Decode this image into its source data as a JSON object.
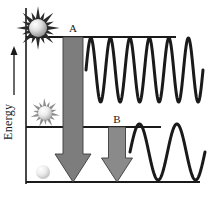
{
  "figure": {
    "type": "energy-level-diagram",
    "background": "#ffffff",
    "width": 208,
    "height": 200
  },
  "axis": {
    "y_label": "Energy",
    "y_arrow_direction": "up",
    "line_color": "#1a1a1a",
    "x_position": 26,
    "top": 8,
    "bottom": 184
  },
  "levels": [
    {
      "id": "excited-high",
      "name": "upper-energy-level",
      "y": 37,
      "x_start": 26,
      "x_end": 176,
      "color": "#1a1a1a"
    },
    {
      "id": "excited-low",
      "name": "middle-energy-level",
      "y": 127,
      "x_start": 26,
      "x_end": 161,
      "color": "#1a1a1a"
    },
    {
      "id": "ground",
      "name": "ground-energy-level",
      "y": 182,
      "x_start": 26,
      "x_end": 200,
      "color": "#1a1a1a"
    }
  ],
  "transitions": [
    {
      "label": "A",
      "label_x": 73,
      "label_y": 32,
      "arrow_color": "#7d7d7d",
      "arrow_stroke": "#3c3c3c",
      "from_y": 37,
      "to_y": 182,
      "center_x": 73,
      "shaft_width": 20,
      "head_width": 36,
      "head_height": 28
    },
    {
      "label": "B",
      "label_x": 117,
      "label_y": 123,
      "arrow_color": "#8a8a8a",
      "arrow_stroke": "#3c3c3c",
      "from_y": 127,
      "to_y": 182,
      "center_x": 117,
      "shaft_width": 17,
      "head_width": 31,
      "head_height": 24
    }
  ],
  "waves": [
    {
      "id": "wave-high-frequency",
      "name": "emitted-photon-wave-A",
      "cycles": 6,
      "amplitude": 32,
      "center_y": 70,
      "x_start": 86,
      "x_end": 203,
      "stroke": "#1a1a1a",
      "stroke_width": 3
    },
    {
      "id": "wave-low-frequency",
      "name": "emitted-photon-wave-B",
      "cycles": 2,
      "amplitude": 28,
      "center_y": 152,
      "x_start": 130,
      "x_end": 205,
      "stroke": "#1a1a1a",
      "stroke_width": 3
    }
  ],
  "atoms": [
    {
      "id": "atom-excited-high",
      "name": "excited-atom-high",
      "cx": 38,
      "cy": 28,
      "radius": 9,
      "burst_rays": 16,
      "burst_length": 14,
      "burst_color": "#2a2a2a",
      "sphere_light": "#f2f2f2",
      "sphere_dark": "#9a9a9a"
    },
    {
      "id": "atom-excited-low",
      "name": "excited-atom-low",
      "cx": 45,
      "cy": 113,
      "radius": 7,
      "burst_rays": 14,
      "burst_length": 9,
      "burst_color": "#8d8d8d",
      "sphere_light": "#f5f5f5",
      "sphere_dark": "#b4b4b4"
    },
    {
      "id": "atom-ground",
      "name": "ground-state-atom",
      "cx": 43,
      "cy": 172,
      "radius": 7,
      "burst_rays": 0,
      "burst_length": 0,
      "burst_color": "none",
      "sphere_light": "#f4f4f4",
      "sphere_dark": "#c2c2c2"
    }
  ],
  "colors": {
    "ink": "#1a1a1a",
    "arrow_fill": "#7d7d7d",
    "arrow_edge": "#3c3c3c",
    "paper": "#ffffff"
  }
}
